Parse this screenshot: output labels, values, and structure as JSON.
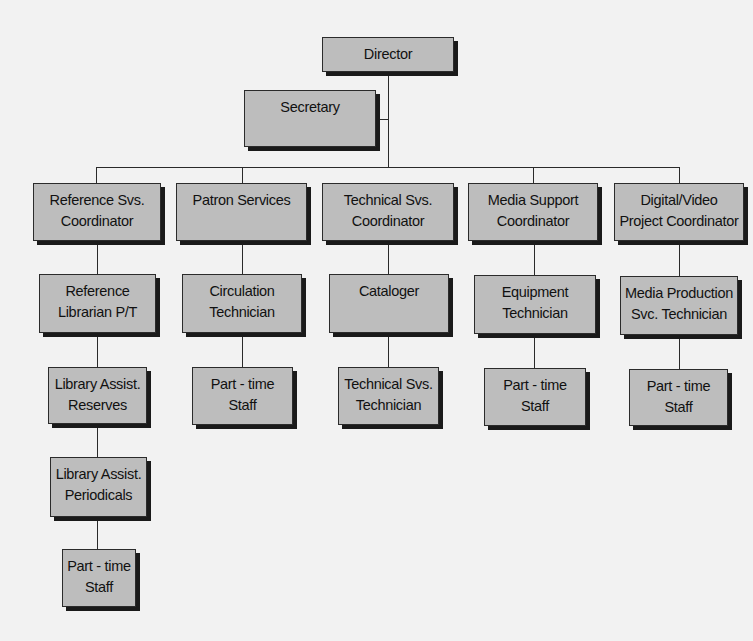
{
  "chart": {
    "nodes": {
      "director": [
        "Director"
      ],
      "secretary": [
        "Secretary"
      ],
      "reference_coord": [
        "Reference Svs.",
        "Coordinator"
      ],
      "patron_services": [
        "Patron Services"
      ],
      "technical_coord": [
        "Technical Svs.",
        "Coordinator"
      ],
      "media_support_coord": [
        "Media Support",
        "Coordinator"
      ],
      "digital_video_coord": [
        "Digital/Video",
        "Project Coordinator"
      ],
      "reference_librarian": [
        "Reference",
        "Librarian P/T"
      ],
      "circulation_tech": [
        "Circulation",
        "Technician"
      ],
      "cataloger": [
        "Cataloger"
      ],
      "equipment_tech": [
        "Equipment",
        "Technician"
      ],
      "media_production_tech": [
        "Media Production",
        "Svc. Technician"
      ],
      "lib_assist_reserves": [
        "Library Assist.",
        "Reserves"
      ],
      "patron_parttime": [
        "Part - time",
        "Staff"
      ],
      "technical_svs_tech": [
        "Technical Svs.",
        "Technician"
      ],
      "equipment_parttime": [
        "Part - time",
        "Staff"
      ],
      "media_parttime": [
        "Part - time",
        "Staff"
      ],
      "lib_assist_periodicals": [
        "Library Assist.",
        "Periodicals"
      ],
      "reference_parttime": [
        "Part - time",
        "Staff"
      ]
    },
    "hierarchy": {
      "Director": {
        "assistant": "Secretary",
        "reports": [
          "Reference Svs. Coordinator",
          "Patron Services",
          "Technical Svs. Coordinator",
          "Media Support Coordinator",
          "Digital/Video Project Coordinator"
        ]
      },
      "Reference Svs. Coordinator": [
        "Reference Librarian P/T"
      ],
      "Reference Librarian P/T": [
        "Library Assist. Reserves"
      ],
      "Library Assist. Reserves": [
        "Library Assist. Periodicals"
      ],
      "Library Assist. Periodicals": [
        "Part - time Staff"
      ],
      "Patron Services": [
        "Circulation Technician"
      ],
      "Circulation Technician": [
        "Part - time Staff"
      ],
      "Technical Svs. Coordinator": [
        "Cataloger"
      ],
      "Cataloger": [
        "Technical Svs. Technician"
      ],
      "Media Support Coordinator": [
        "Equipment Technician"
      ],
      "Equipment Technician": [
        "Part - time Staff"
      ],
      "Digital/Video Project Coordinator": [
        "Media Production Svc. Technician"
      ],
      "Media Production Svc. Technician": [
        "Part - time Staff"
      ]
    },
    "colors": {
      "box_fill": "#bdbdbd",
      "box_border": "#2b2b2b",
      "shadow": "#1a1a1a",
      "background": "#f2f2f2",
      "line": "#2a2a2a"
    }
  }
}
